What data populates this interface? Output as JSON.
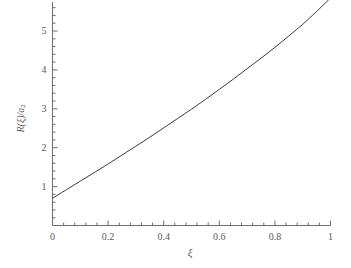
{
  "chart_data": {
    "type": "line",
    "title": "",
    "subtitle": "",
    "xlabel": "ξ",
    "ylabel": "R(ξ)/a",
    "ylabel_sub": "2",
    "xlim": [
      0,
      1
    ],
    "ylim": [
      0,
      6
    ],
    "grid": false,
    "legend": null,
    "xticks": [
      0,
      0.2,
      0.4,
      0.6,
      0.8,
      1
    ],
    "xtick_labels": [
      "0",
      "0.2",
      "0.4",
      "0.6",
      "0.8",
      "1"
    ],
    "x_minor_tick_count": 4,
    "yticks": [
      1,
      2,
      3,
      4,
      5
    ],
    "ytick_labels": [
      "1",
      "2",
      "3",
      "4",
      "5"
    ],
    "y_minor_tick_count": 4,
    "line_color": "#3c3c3c",
    "line_width": 1,
    "axis_color": "#6e6e6e",
    "background": "#ffffff",
    "series": [
      {
        "name": "R(ξ)/a2",
        "x": [
          0.0,
          0.05,
          0.1,
          0.15,
          0.2,
          0.25,
          0.3,
          0.35,
          0.4,
          0.45,
          0.5,
          0.55,
          0.6,
          0.65,
          0.7,
          0.75,
          0.8,
          0.85,
          0.9,
          0.95,
          1.0
        ],
        "values": [
          0.7,
          0.92,
          1.14,
          1.36,
          1.58,
          1.81,
          2.04,
          2.27,
          2.51,
          2.75,
          2.99,
          3.24,
          3.5,
          3.76,
          4.03,
          4.3,
          4.58,
          4.87,
          5.17,
          5.5,
          5.85
        ]
      }
    ]
  }
}
